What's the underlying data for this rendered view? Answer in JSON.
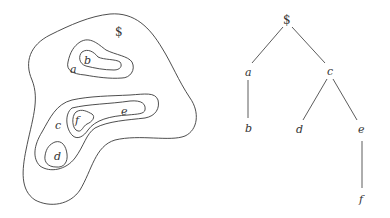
{
  "diagram": {
    "region_view": {
      "root_label": "$",
      "labels": [
        "a",
        "b",
        "c",
        "d",
        "e",
        "f"
      ]
    },
    "tree_view": {
      "nodes": [
        {
          "id": "root",
          "label": "$"
        },
        {
          "id": "a",
          "label": "a"
        },
        {
          "id": "b",
          "label": "b"
        },
        {
          "id": "c",
          "label": "c"
        },
        {
          "id": "d",
          "label": "d"
        },
        {
          "id": "e",
          "label": "e"
        },
        {
          "id": "f",
          "label": "f"
        }
      ],
      "edges": [
        [
          "$",
          "a"
        ],
        [
          "$",
          "c"
        ],
        [
          "a",
          "b"
        ],
        [
          "c",
          "d"
        ],
        [
          "c",
          "e"
        ],
        [
          "e",
          "f"
        ]
      ]
    },
    "colors": {
      "stroke": "#3a3a3a",
      "background": "#ffffff"
    }
  }
}
